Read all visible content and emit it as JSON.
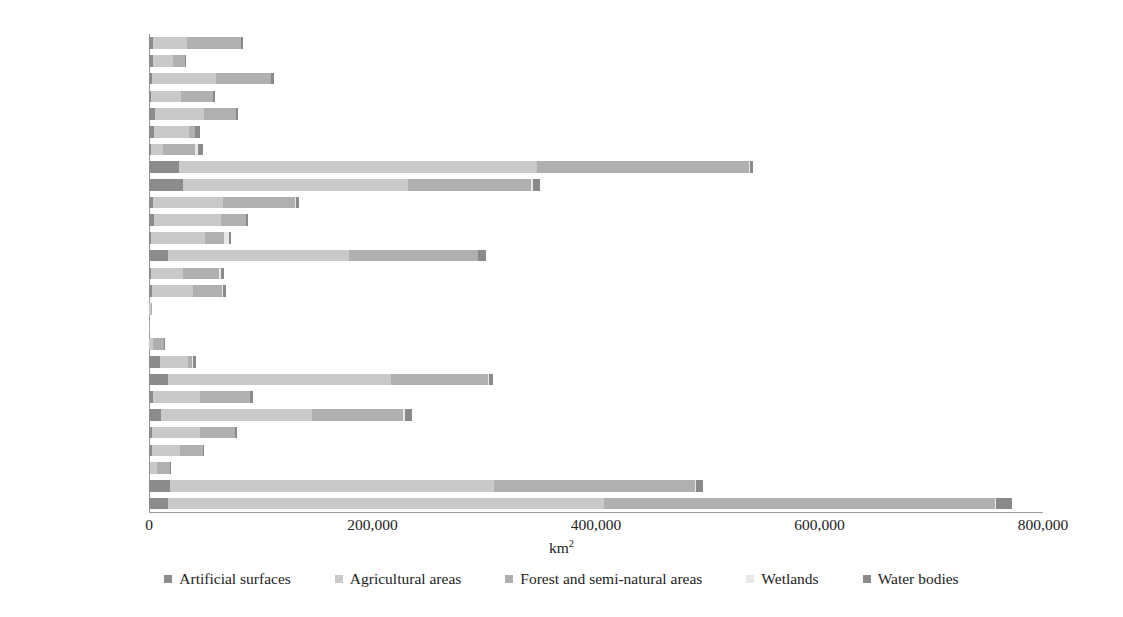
{
  "chart_data": {
    "type": "bar",
    "orientation": "horizontal",
    "stacked": true,
    "title": "",
    "xlabel": "km²",
    "ylabel": "",
    "xlim": [
      0,
      800000
    ],
    "xticks": [
      0,
      200000,
      400000,
      600000,
      800000
    ],
    "xtick_labels": [
      "0",
      "200,000",
      "400,000",
      "600,000",
      "800,000"
    ],
    "grid": false,
    "legend_position": "bottom",
    "categories": [
      "Austria",
      "Belgium",
      "Bulgaria",
      "Croatia",
      "Czech Republic",
      "Denmark",
      "Estonia",
      "France",
      "Germany",
      "Greece",
      "Hungary",
      "Ireland",
      "Italy",
      "Latvia",
      "Lithuania",
      "Luxembourg",
      "Malta",
      "Montenegro",
      "Netherlands",
      "Poland",
      "Portugal",
      "Romania",
      "Serbia",
      "Slovakia",
      "Slovenia",
      "Spain",
      "Turkey"
    ],
    "series": [
      {
        "name": "Artificial surfaces",
        "color": "#8c8c8c",
        "values": [
          3400,
          3900,
          3000,
          1900,
          5200,
          4500,
          1600,
          27000,
          30000,
          4000,
          4600,
          2200,
          17000,
          1500,
          2300,
          300,
          120,
          400,
          9800,
          17000,
          3300,
          11000,
          2800,
          3100,
          900,
          19000,
          17000
        ]
      },
      {
        "name": "Agricultural areas",
        "color": "#c9c9c9",
        "values": [
          31000,
          18000,
          57000,
          27000,
          44000,
          31000,
          11000,
          320000,
          202000,
          62000,
          60000,
          48000,
          162000,
          29000,
          37000,
          1400,
          90,
          3500,
          25000,
          200000,
          42000,
          135000,
          43000,
          25000,
          6200,
          290000,
          390000
        ]
      },
      {
        "name": "Forest and semi-natural areas",
        "color": "#b0b0b0",
        "values": [
          48000,
          10000,
          49000,
          28000,
          29000,
          5500,
          29000,
          190000,
          110000,
          65000,
          22000,
          17000,
          115000,
          32000,
          26000,
          900,
          70,
          9500,
          3800,
          86000,
          45000,
          81000,
          31000,
          20000,
          12000,
          180000,
          350000
        ]
      },
      {
        "name": "Wetlands",
        "color": "#e8e8e8",
        "values": [
          200,
          100,
          300,
          200,
          100,
          400,
          2000,
          1200,
          1800,
          400,
          300,
          4000,
          500,
          1800,
          800,
          20,
          5,
          100,
          400,
          1500,
          200,
          2000,
          200,
          100,
          50,
          600,
          1000
        ]
      },
      {
        "name": "Water bodies",
        "color": "#8a8a8a",
        "values": [
          1200,
          700,
          2500,
          1600,
          1600,
          4000,
          4800,
          2600,
          6000,
          3000,
          1600,
          2000,
          7200,
          3000,
          2800,
          30,
          5,
          400,
          3500,
          3800,
          2200,
          6500,
          1500,
          900,
          120,
          6400,
          14000
        ]
      }
    ]
  }
}
